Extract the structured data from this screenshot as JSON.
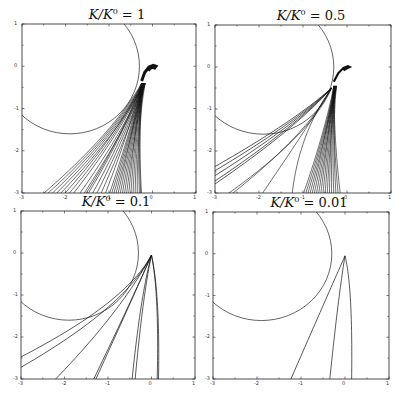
{
  "chart_data": [
    {
      "type": "line",
      "title": "K/K^0 = 1",
      "title_parts": {
        "lhs": "K/K",
        "sup": "0",
        "rhs": " = 1"
      },
      "xlim": [
        -3,
        1
      ],
      "ylim": [
        -3,
        1
      ],
      "xticks": [
        "-3",
        "-2",
        "-1",
        "0",
        "1"
      ],
      "yticks": [
        "1",
        "0",
        "-1",
        "-2",
        "-3"
      ],
      "circle": {
        "cx": -1.9,
        "cy": 0,
        "r": 1.6
      },
      "n_trajectories": "many (~40)",
      "description": "Dense bundle of trajectories from near (0,0) with a curl at top, fanning down to x between -2.5 and -0.2 at y=-3"
    },
    {
      "type": "line",
      "title": "K/K^0 = 0.5",
      "title_parts": {
        "lhs": "K/K",
        "sup": "0",
        "rhs": " = 0.5"
      },
      "xlim": [
        -3,
        1
      ],
      "ylim": [
        -3,
        1
      ],
      "xticks": [
        "-3",
        "-2",
        "-1",
        "0",
        "1"
      ],
      "yticks": [
        "1",
        "0",
        "-1",
        "-2",
        "-3"
      ],
      "circle": {
        "cx": -1.9,
        "cy": 0,
        "r": 1.6
      },
      "description": "Bundle of trajectories from near (0,0), some tangent to circle exiting left edge at y≈-2.4 to -2.8"
    },
    {
      "type": "line",
      "title": "K/K^0 = 0.1",
      "title_parts": {
        "lhs": "K/K",
        "sup": "0",
        "rhs": " = 0.1"
      },
      "xlim": [
        -3,
        1
      ],
      "ylim": [
        -3,
        1
      ],
      "xticks": [
        "-3",
        "-2",
        "-1",
        "0",
        "1"
      ],
      "yticks": [
        "1",
        "0",
        "-1",
        "-2",
        "-3"
      ],
      "circle": {
        "cx": -1.9,
        "cy": 0,
        "r": 1.6
      },
      "description": "About 9 trajectories from (0,0) fanning out"
    },
    {
      "type": "line",
      "title": "K/K^0 = 0.01",
      "title_parts": {
        "lhs": "K/K",
        "sup": "0",
        "rhs": " = 0.01"
      },
      "xlim": [
        -3,
        1
      ],
      "ylim": [
        -3,
        1
      ],
      "xticks": [
        "-3",
        "-2",
        "-1",
        "0",
        "1"
      ],
      "yticks": [
        "1",
        "0",
        "-1",
        "-2",
        "-3"
      ],
      "circle": {
        "cx": -1.9,
        "cy": 0,
        "r": 1.6
      },
      "description": "3 trajectories from (0,0) to x≈-1.25, -0.35, 0.15 at y=-3"
    }
  ],
  "panels": [
    {
      "title_lhs": "K/K",
      "title_sup": "0",
      "title_rhs": " = 1"
    },
    {
      "title_lhs": "K/K",
      "title_sup": "0",
      "title_rhs": " = 0.5"
    },
    {
      "title_lhs": "K/K",
      "title_sup": "0",
      "title_rhs": " = 0.1"
    },
    {
      "title_lhs": "K/K",
      "title_sup": "0",
      "title_rhs": " = 0.01"
    }
  ],
  "ticks": {
    "x": [
      "-3",
      "-2",
      "-1",
      "0",
      "1"
    ],
    "y": [
      "1",
      "0",
      "-1",
      "-2",
      "-3"
    ]
  }
}
